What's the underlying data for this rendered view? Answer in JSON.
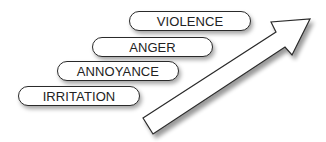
{
  "diagram": {
    "type": "escalation-staircase",
    "levels": [
      {
        "label": "IRRITATION"
      },
      {
        "label": "ANNOYANCE"
      },
      {
        "label": "ANGER"
      },
      {
        "label": "VIOLENCE"
      }
    ],
    "arrow": {
      "direction": "up-right"
    }
  },
  "colors": {
    "stroke": "#2a2a2a",
    "fill": "#ffffff",
    "text": "#222222"
  }
}
